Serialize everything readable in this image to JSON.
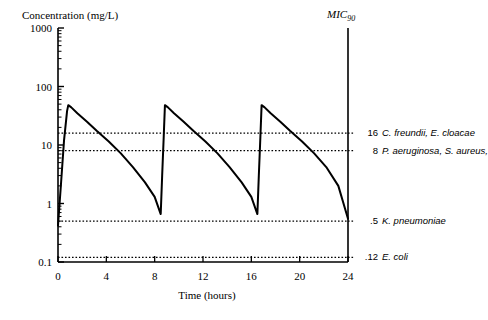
{
  "chart_data": {
    "type": "line",
    "title": "",
    "ylabel": "Concentration (mg/L)",
    "xlabel": "Time (hours)",
    "yscale": "log",
    "ylim": [
      0.1,
      1000
    ],
    "xlim": [
      0,
      24
    ],
    "grid": false,
    "legend": "none",
    "secondary_axis_label": "MIC",
    "secondary_axis_label_sub": "90",
    "ytick_labels": [
      "1000",
      "100",
      "10",
      "1",
      "0.1"
    ],
    "ytick_values": [
      1000,
      100,
      10,
      1,
      0.1
    ],
    "xtick_labels": [
      "0",
      "4",
      "8",
      "12",
      "16",
      "20",
      "24"
    ],
    "xtick_values": [
      0,
      4,
      8,
      12,
      16,
      20,
      24
    ],
    "series": [
      {
        "name": "Serum concentration",
        "style": "solid",
        "points": [
          [
            0.0,
            0.42
          ],
          [
            0.25,
            2.2
          ],
          [
            0.5,
            12.0
          ],
          [
            0.75,
            38.0
          ],
          [
            0.85,
            48.0
          ],
          [
            1.1,
            44.0
          ],
          [
            1.6,
            35.0
          ],
          [
            2.4,
            25.0
          ],
          [
            3.2,
            17.5
          ],
          [
            4.2,
            11.5
          ],
          [
            5.2,
            7.2
          ],
          [
            6.2,
            4.2
          ],
          [
            7.2,
            2.3
          ],
          [
            8.0,
            1.3
          ],
          [
            8.5,
            0.66
          ],
          [
            8.62,
            3.0
          ],
          [
            8.75,
            14.0
          ],
          [
            8.85,
            48.0
          ],
          [
            9.1,
            44.0
          ],
          [
            9.6,
            35.0
          ],
          [
            10.4,
            25.0
          ],
          [
            11.2,
            17.5
          ],
          [
            12.2,
            11.5
          ],
          [
            13.2,
            7.2
          ],
          [
            14.2,
            4.2
          ],
          [
            15.2,
            2.3
          ],
          [
            16.0,
            1.3
          ],
          [
            16.5,
            0.66
          ],
          [
            16.62,
            3.0
          ],
          [
            16.75,
            14.0
          ],
          [
            16.85,
            48.0
          ],
          [
            17.1,
            44.0
          ],
          [
            17.6,
            35.0
          ],
          [
            18.4,
            25.0
          ],
          [
            19.2,
            17.5
          ],
          [
            20.2,
            11.5
          ],
          [
            21.2,
            7.2
          ],
          [
            22.2,
            4.2
          ],
          [
            23.2,
            2.0
          ],
          [
            24.0,
            0.55
          ]
        ]
      }
    ],
    "mic_lines": [
      {
        "value": 16,
        "value_label": "16",
        "organisms": "C. freundii, E. cloacae",
        "style": "dotted"
      },
      {
        "value": 8,
        "value_label": "8",
        "organisms": "P. aeruginosa, S. aureus,",
        "style": "dotted"
      },
      {
        "value": 0.5,
        "value_label": ".5",
        "organisms": "K. pneumoniae",
        "style": "dotted"
      },
      {
        "value": 0.12,
        "value_label": ".12",
        "organisms": "E. coli",
        "style": "dotted"
      }
    ],
    "colors": {
      "curve": "#000000",
      "axis": "#000000",
      "mic_line": "#000000",
      "background": "#ffffff"
    }
  }
}
